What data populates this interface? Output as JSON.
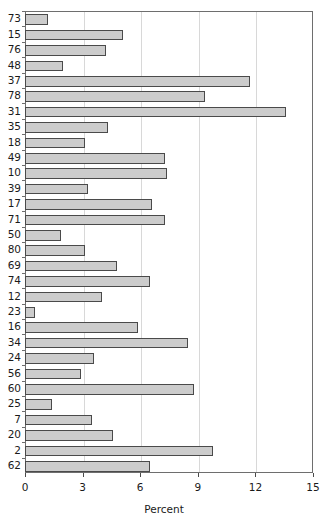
{
  "chart_data": {
    "type": "bar",
    "orientation": "horizontal",
    "title": "",
    "subtitle": "",
    "xlabel": "Percent",
    "ylabel": "",
    "xlim": [
      0,
      15
    ],
    "xticks": [
      0,
      3,
      6,
      9,
      12,
      15
    ],
    "xtick_labels": [
      "0",
      "3",
      "6",
      "9",
      "12",
      "15"
    ],
    "grid": "vertical",
    "legend": "none",
    "bar_fill_color": "#cccccc",
    "bar_edge_color": "#4a4a4a",
    "axis_color": "#6e6e6e",
    "gridline_color": "#d8d8d8",
    "categories": [
      "73",
      "15",
      "76",
      "48",
      "37",
      "78",
      "31",
      "35",
      "18",
      "49",
      "10",
      "39",
      "17",
      "71",
      "50",
      "80",
      "69",
      "74",
      "12",
      "23",
      "16",
      "34",
      "24",
      "56",
      "60",
      "25",
      "7",
      "20",
      "2",
      "62"
    ],
    "values": [
      1.2,
      5.1,
      4.2,
      2.0,
      11.7,
      9.4,
      13.6,
      4.3,
      3.1,
      7.3,
      7.4,
      3.3,
      6.6,
      7.3,
      1.9,
      3.1,
      4.8,
      6.5,
      4.0,
      0.5,
      5.9,
      8.5,
      3.6,
      2.9,
      8.8,
      1.4,
      3.5,
      4.6,
      9.8,
      6.5
    ]
  }
}
